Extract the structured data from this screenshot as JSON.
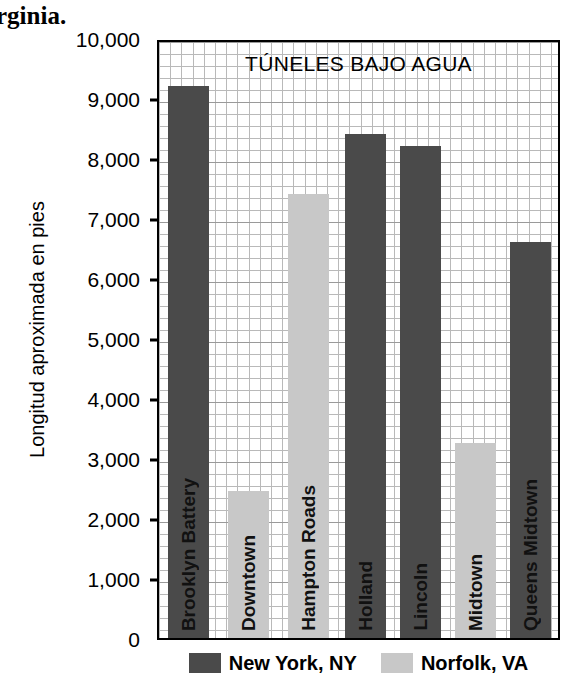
{
  "page_fragment": "rginia.",
  "chart_data": {
    "type": "bar",
    "title": "TÚNELES BAJO AGUA",
    "xlabel": "",
    "ylabel": "Longitud aproximada en pies",
    "ylim": [
      0,
      10000
    ],
    "ytick_labels": [
      "10,000",
      "9,000",
      "8,000",
      "7,000",
      "6,000",
      "5,000",
      "4,000",
      "3,000",
      "2,000",
      "1,000",
      "0"
    ],
    "ytick_values": [
      10000,
      9000,
      8000,
      7000,
      6000,
      5000,
      4000,
      3000,
      2000,
      1000,
      0
    ],
    "grid": true,
    "legend_position": "bottom",
    "categories": [
      "Brooklyn Battery",
      "Downtown",
      "Hampton Roads",
      "Holland",
      "Lincoln",
      "Midtown",
      "Queens Midtown"
    ],
    "values": [
      9200,
      2450,
      7400,
      8400,
      8200,
      3250,
      6600
    ],
    "series": [
      {
        "name": "New York, NY",
        "color": "#4a4a4a",
        "points": [
          {
            "category": "Brooklyn Battery",
            "value": 9200
          },
          {
            "category": "Holland",
            "value": 8400
          },
          {
            "category": "Lincoln",
            "value": 8200
          },
          {
            "category": "Queens Midtown",
            "value": 6600
          }
        ]
      },
      {
        "name": "Norfolk, VA",
        "color": "#c8c8c8",
        "points": [
          {
            "category": "Downtown",
            "value": 2450
          },
          {
            "category": "Hampton Roads",
            "value": 7400
          },
          {
            "category": "Midtown",
            "value": 3250
          }
        ]
      }
    ],
    "bars": [
      {
        "label": "Brooklyn Battery",
        "value": 9200,
        "series": "New York, NY",
        "color": "#4a4a4a"
      },
      {
        "label": "Downtown",
        "value": 2450,
        "series": "Norfolk, VA",
        "color": "#c8c8c8"
      },
      {
        "label": "Hampton Roads",
        "value": 7400,
        "series": "Norfolk, VA",
        "color": "#c8c8c8"
      },
      {
        "label": "Holland",
        "value": 8400,
        "series": "New York, NY",
        "color": "#4a4a4a"
      },
      {
        "label": "Lincoln",
        "value": 8200,
        "series": "New York, NY",
        "color": "#4a4a4a"
      },
      {
        "label": "Midtown",
        "value": 3250,
        "series": "Norfolk, VA",
        "color": "#c8c8c8"
      },
      {
        "label": "Queens Midtown",
        "value": 6600,
        "series": "New York, NY",
        "color": "#4a4a4a"
      }
    ],
    "legend": [
      {
        "label": "New York, NY",
        "color": "#4a4a4a"
      },
      {
        "label": "Norfolk, VA",
        "color": "#c8c8c8"
      }
    ]
  }
}
